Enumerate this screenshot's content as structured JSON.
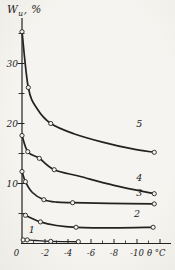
{
  "figure": {
    "background": "#f2f1ec",
    "ink": "#222222"
  },
  "y_axis": {
    "title_base": "W",
    "title_sub": "u",
    "title_suffix": ", %",
    "tick_values": [
      10,
      20,
      30
    ],
    "tick_labels": [
      "10",
      "20",
      "30"
    ],
    "minor_tick_values": [
      5,
      15,
      25,
      35
    ]
  },
  "x_axis": {
    "origin_label": "0",
    "unit_label": "θ °C",
    "tick_values": [
      -2,
      -4,
      -6,
      -8,
      -10
    ],
    "tick_labels": [
      "-2",
      "-4",
      "-6",
      "-8",
      "-10"
    ]
  },
  "chart_data": {
    "type": "line",
    "title": "",
    "xlabel": "θ, °C",
    "ylabel": "Wu, %",
    "xlim": [
      0,
      -12.5
    ],
    "ylim": [
      0,
      36
    ],
    "grid": false,
    "marker": "open-circle",
    "legend": "curve numbers printed on lines",
    "series": [
      {
        "name": "1",
        "label_xy": [
          -0.85,
          1.8
        ],
        "markers": [
          [
            -0.1,
            0.6
          ],
          [
            -0.45,
            0.6
          ],
          [
            -2.5,
            0.35
          ],
          [
            -4.9,
            0.3
          ]
        ],
        "curve": [
          [
            -0.1,
            0.6
          ],
          [
            -0.45,
            0.6
          ],
          [
            -1.2,
            0.5
          ],
          [
            -2.5,
            0.35
          ],
          [
            -4.9,
            0.3
          ]
        ]
      },
      {
        "name": "2",
        "label_xy": [
          -10.0,
          4.5
        ],
        "markers": [
          [
            -0.3,
            4.7
          ],
          [
            -1.6,
            3.6
          ],
          [
            -4.7,
            2.7
          ],
          [
            -11.4,
            2.7
          ]
        ],
        "curve": [
          [
            -0.3,
            4.7
          ],
          [
            -1.6,
            3.6
          ],
          [
            -3.0,
            3.0
          ],
          [
            -4.7,
            2.7
          ],
          [
            -8.0,
            2.6
          ],
          [
            -11.4,
            2.7
          ]
        ]
      },
      {
        "name": "3",
        "label_xy": [
          -10.2,
          7.95
        ],
        "markers": [
          [
            0,
            12.0
          ],
          [
            -0.3,
            10.3
          ],
          [
            -1.9,
            7.3
          ],
          [
            -4.4,
            6.8
          ],
          [
            -11.5,
            6.6
          ]
        ],
        "curve": [
          [
            0,
            12.0
          ],
          [
            -0.3,
            10.3
          ],
          [
            -0.9,
            8.5
          ],
          [
            -1.9,
            7.3
          ],
          [
            -3.0,
            6.9
          ],
          [
            -4.4,
            6.8
          ],
          [
            -7.5,
            6.7
          ],
          [
            -11.5,
            6.6
          ]
        ]
      },
      {
        "name": "4",
        "label_xy": [
          -10.2,
          10.5
        ],
        "markers": [
          [
            0,
            18.0
          ],
          [
            -0.5,
            15.3
          ],
          [
            -1.5,
            14.2
          ],
          [
            -2.8,
            12.3
          ],
          [
            -11.5,
            8.3
          ]
        ],
        "curve": [
          [
            0,
            18.0
          ],
          [
            -0.5,
            15.3
          ],
          [
            -1.5,
            14.2
          ],
          [
            -2.8,
            12.3
          ],
          [
            -5.0,
            11.2
          ],
          [
            -8.0,
            9.7
          ],
          [
            -11.5,
            8.3
          ]
        ]
      },
      {
        "name": "5",
        "label_xy": [
          -10.2,
          19.4
        ],
        "markers": [
          [
            0,
            35.3
          ],
          [
            -0.55,
            26.0
          ],
          [
            -2.5,
            20.0
          ],
          [
            -11.5,
            15.2
          ]
        ],
        "curve": [
          [
            0,
            35.3
          ],
          [
            -0.55,
            26.0
          ],
          [
            -1.3,
            22.5
          ],
          [
            -2.5,
            20.0
          ],
          [
            -4.5,
            18.3
          ],
          [
            -7.0,
            16.9
          ],
          [
            -9.5,
            15.8
          ],
          [
            -11.5,
            15.2
          ]
        ]
      }
    ]
  }
}
